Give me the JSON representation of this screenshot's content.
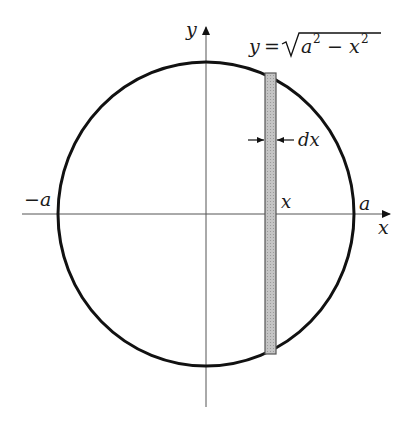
{
  "diagram": {
    "equation": {
      "lhs": "y",
      "eq": "=",
      "radicand_a": "a",
      "radicand_exp1": "2",
      "minus": "−",
      "radicand_x": "x",
      "radicand_exp2": "2"
    },
    "labels": {
      "y_axis": "y",
      "x_axis": "x",
      "neg_a": "−a",
      "pos_a": "a",
      "strip_x": "x",
      "dx": "dx"
    },
    "geometry": {
      "center": [
        206,
        214
      ],
      "rx": 148,
      "ry": 152,
      "strip": {
        "x_left": 265,
        "width": 11,
        "y_top": 73,
        "y_bottom": 354
      }
    },
    "colors": {
      "curve": "#111111",
      "axis": "#555555",
      "strip_fill": "#b8b8b8",
      "strip_stroke": "#555555"
    }
  }
}
